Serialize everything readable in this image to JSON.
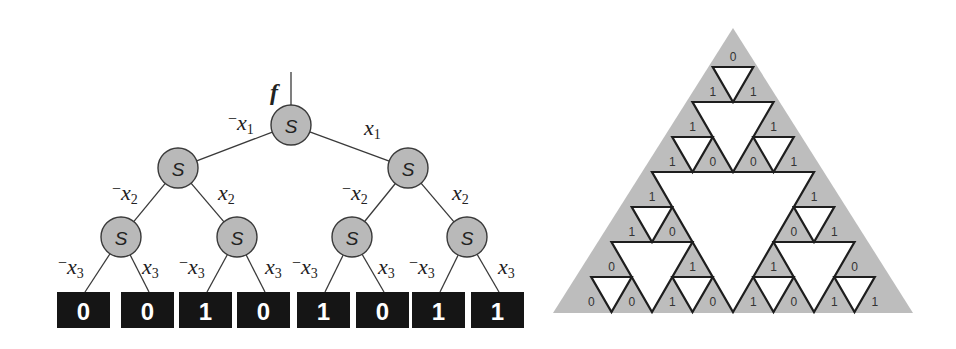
{
  "tree": {
    "output_label": "f",
    "node_label": "S",
    "colors": {
      "node_fill": "#b9b9b9",
      "leaf_fill": "#151515",
      "leaf_text": "#ffffff"
    },
    "root": {
      "x": 291,
      "y": 125
    },
    "level1": [
      {
        "x": 178,
        "y": 168
      },
      {
        "x": 408,
        "y": 168
      }
    ],
    "level2": [
      {
        "x": 121,
        "y": 237
      },
      {
        "x": 237,
        "y": 237
      },
      {
        "x": 352,
        "y": 237
      },
      {
        "x": 467,
        "y": 237
      }
    ],
    "edge_labels": {
      "x1_neg": "x",
      "x1_pos": "x",
      "x2_neg": "x",
      "x2_pos": "x",
      "x3_neg": "x",
      "x3_pos": "x"
    },
    "variables": [
      "x1",
      "x2",
      "x3"
    ],
    "leaves": [
      "0",
      "0",
      "1",
      "0",
      "1",
      "0",
      "1",
      "1"
    ]
  },
  "sierpinski": {
    "colors": {
      "background": "#bdbdbd",
      "holes": "#ffffff",
      "outline": "#1e1e1e"
    },
    "outer": {
      "apex_x": 733,
      "apex_y": 28,
      "base_y": 313,
      "base_left": 553,
      "base_right": 913
    },
    "fractal": {
      "apex_x": 733,
      "apex_y": 32,
      "base_y": 312,
      "half_width": 162
    },
    "blocks": [
      {
        "name": "top-top",
        "labels": [
          "0",
          "1",
          "1"
        ]
      },
      {
        "name": "top-left",
        "labels": [
          "1",
          "1",
          "0"
        ]
      },
      {
        "name": "top-right",
        "labels": [
          "1",
          "0",
          "1"
        ]
      },
      {
        "name": "left-top",
        "labels": [
          "1",
          "1",
          "0"
        ]
      },
      {
        "name": "left-left",
        "labels": [
          "0",
          "0",
          "0"
        ]
      },
      {
        "name": "left-right",
        "labels": [
          "1",
          "1",
          "0"
        ]
      },
      {
        "name": "right-top",
        "labels": [
          "1",
          "0",
          "1"
        ]
      },
      {
        "name": "right-left",
        "labels": [
          "1",
          "1",
          "0"
        ]
      },
      {
        "name": "right-right",
        "labels": [
          "0",
          "1",
          "1"
        ]
      }
    ],
    "bottom_row": [
      "0",
      "0",
      "1",
      "0",
      "1",
      "0",
      "1",
      "1"
    ]
  }
}
